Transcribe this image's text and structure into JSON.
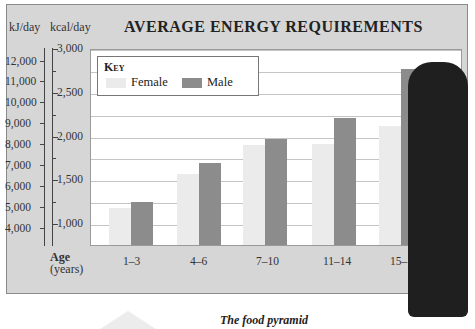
{
  "header": {
    "unit_kj": "kJ/day",
    "unit_kcal": "kcal/day",
    "title": "AVERAGE ENERGY REQUIREMENTS"
  },
  "key": {
    "title": "Key",
    "female_label": "Female",
    "male_label": "Male",
    "female_color": "#ebebeb",
    "male_color": "#8c8c8c"
  },
  "axis": {
    "kj_ticks": [
      "12,000",
      "11,000",
      "10,000",
      "9,000",
      "8,000",
      "7,000",
      "6,000",
      "5,000",
      "4,000"
    ],
    "kcal_ticks": [
      "3,000",
      "2,500",
      "2,000",
      "1,500",
      "1,000"
    ],
    "x_title": "Age",
    "x_unit": "(years)",
    "x_labels": [
      "1–3",
      "4–6",
      "7–10",
      "11–14",
      "15–18"
    ]
  },
  "caption": "The food pyramid",
  "chart_data": {
    "type": "bar",
    "title": "AVERAGE ENERGY REQUIREMENTS",
    "xlabel": "Age (years)",
    "ylabel": "kcal/day",
    "ylabel_secondary": "kJ/day",
    "categories": [
      "1–3",
      "4–6",
      "7–10",
      "11–14",
      "15–18"
    ],
    "series": [
      {
        "name": "Female",
        "values": [
          1170,
          1560,
          1890,
          1900,
          2110
        ]
      },
      {
        "name": "Male",
        "values": [
          1240,
          1690,
          1960,
          2200,
          2760
        ]
      }
    ],
    "ylim": [
      750,
      3000
    ],
    "ylim_secondary_kj": [
      3150,
      12600
    ],
    "y_ticks_kcal": [
      1000,
      1500,
      2000,
      2500,
      3000
    ],
    "y_ticks_kj": [
      4000,
      5000,
      6000,
      7000,
      8000,
      9000,
      10000,
      11000,
      12000
    ],
    "grid": true,
    "legend_position": "top-left inside"
  }
}
